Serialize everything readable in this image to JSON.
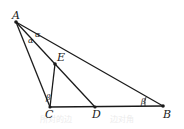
{
  "diagram": {
    "points": [
      {
        "id": "A",
        "label": "A"
      },
      {
        "id": "B",
        "label": "B"
      },
      {
        "id": "C",
        "label": "C"
      },
      {
        "id": "D",
        "label": "D"
      },
      {
        "id": "E",
        "label": "E"
      }
    ],
    "segments": [
      "AC",
      "AB",
      "AE",
      "CB",
      "CE",
      "ED"
    ],
    "angles": [
      {
        "id": "angle-CAE",
        "label": "α"
      },
      {
        "id": "angle-EAB",
        "label": "α"
      },
      {
        "id": "angle-ACE",
        "label": "β"
      },
      {
        "id": "angle-ABC",
        "label": "β"
      }
    ],
    "background_text": [
      "所对的边",
      "边对角"
    ]
  }
}
